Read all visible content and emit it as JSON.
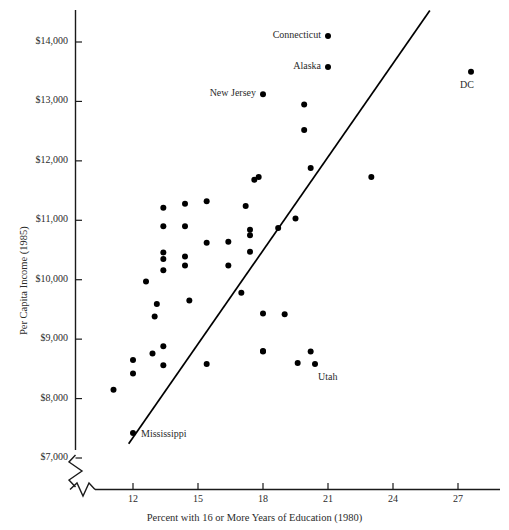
{
  "chart_data": {
    "type": "scatter",
    "title": "",
    "xlabel": "Percent with 16 or More Years of Education (1980)",
    "ylabel": "Per Capita Income (1985)",
    "xlim": [
      10.4,
      28.7
    ],
    "ylim": [
      7000,
      14600
    ],
    "xticks": [
      12,
      15,
      18,
      21,
      24,
      27
    ],
    "xtick_labels": [
      "12",
      "15",
      "18",
      "21",
      "24",
      "27"
    ],
    "yticks": [
      7000,
      8000,
      9000,
      10000,
      11000,
      12000,
      13000,
      14000
    ],
    "ytick_labels": [
      "$7,000",
      "$8,000",
      "$9,000",
      "$10,000",
      "$11,000",
      "$12,000",
      "$13,000",
      "$14,000"
    ],
    "grid": false,
    "legend": null,
    "axis_break": {
      "x_axis": true,
      "y_axis": true,
      "note": "zigzag break symbols near origin on both axes"
    },
    "marker": {
      "shape": "filled-circle",
      "color": "#000000",
      "size_px": 6
    },
    "trend_line": {
      "type": "linear-fit",
      "color": "#000000",
      "x_start": 11.8,
      "y_start": 7240,
      "x_end": 25.7,
      "y_end": 14530
    },
    "points": [
      {
        "x": 11.1,
        "y": 8150,
        "label": null
      },
      {
        "x": 12.0,
        "y": 7420,
        "label": "Mississippi",
        "label_pos": "right"
      },
      {
        "x": 12.0,
        "y": 8650,
        "label": null
      },
      {
        "x": 12.0,
        "y": 8420,
        "label": null
      },
      {
        "x": 12.9,
        "y": 8760,
        "label": null
      },
      {
        "x": 12.6,
        "y": 9970,
        "label": null
      },
      {
        "x": 13.0,
        "y": 9380,
        "label": null
      },
      {
        "x": 13.1,
        "y": 9590,
        "label": null
      },
      {
        "x": 13.4,
        "y": 8560,
        "label": null
      },
      {
        "x": 13.4,
        "y": 8880,
        "label": null
      },
      {
        "x": 13.4,
        "y": 10160,
        "label": null
      },
      {
        "x": 13.4,
        "y": 10350,
        "label": null
      },
      {
        "x": 13.4,
        "y": 10460,
        "label": null
      },
      {
        "x": 13.4,
        "y": 11210,
        "label": null
      },
      {
        "x": 13.4,
        "y": 10900,
        "label": null
      },
      {
        "x": 14.4,
        "y": 10240,
        "label": null
      },
      {
        "x": 14.4,
        "y": 10390,
        "label": null
      },
      {
        "x": 14.4,
        "y": 10900,
        "label": null
      },
      {
        "x": 14.4,
        "y": 11280,
        "label": null
      },
      {
        "x": 14.6,
        "y": 9650,
        "label": null
      },
      {
        "x": 15.4,
        "y": 8580,
        "label": null
      },
      {
        "x": 15.4,
        "y": 11320,
        "label": null
      },
      {
        "x": 15.4,
        "y": 10620,
        "label": null
      },
      {
        "x": 16.4,
        "y": 10240,
        "label": null
      },
      {
        "x": 16.4,
        "y": 10640,
        "label": null
      },
      {
        "x": 17.0,
        "y": 9780,
        "label": null
      },
      {
        "x": 17.2,
        "y": 11240,
        "label": null
      },
      {
        "x": 17.4,
        "y": 10470,
        "label": null
      },
      {
        "x": 17.4,
        "y": 10750,
        "label": null
      },
      {
        "x": 17.4,
        "y": 10840,
        "label": null
      },
      {
        "x": 17.6,
        "y": 11680,
        "label": null
      },
      {
        "x": 17.8,
        "y": 11730,
        "label": null
      },
      {
        "x": 18.0,
        "y": 8800,
        "label": null
      },
      {
        "x": 18.0,
        "y": 8790,
        "label": null
      },
      {
        "x": 18.0,
        "y": 9430,
        "label": null
      },
      {
        "x": 18.0,
        "y": 13120,
        "label": "New Jersey",
        "label_pos": "left"
      },
      {
        "x": 18.7,
        "y": 10870,
        "label": null
      },
      {
        "x": 19.0,
        "y": 9420,
        "label": null
      },
      {
        "x": 19.5,
        "y": 11030,
        "label": null
      },
      {
        "x": 19.6,
        "y": 8600,
        "label": null
      },
      {
        "x": 19.9,
        "y": 12950,
        "label": null
      },
      {
        "x": 19.9,
        "y": 12520,
        "label": null
      },
      {
        "x": 20.2,
        "y": 8790,
        "label": null
      },
      {
        "x": 20.2,
        "y": 11880,
        "label": null
      },
      {
        "x": 20.4,
        "y": 8580,
        "label": "Utah",
        "label_pos": "below-right"
      },
      {
        "x": 21.0,
        "y": 14100,
        "label": "Connecticut",
        "label_pos": "left"
      },
      {
        "x": 21.0,
        "y": 13580,
        "label": "Alaska",
        "label_pos": "left"
      },
      {
        "x": 23.0,
        "y": 11730,
        "label": null
      },
      {
        "x": 27.6,
        "y": 13500,
        "label": "DC",
        "label_pos": "below"
      }
    ]
  }
}
